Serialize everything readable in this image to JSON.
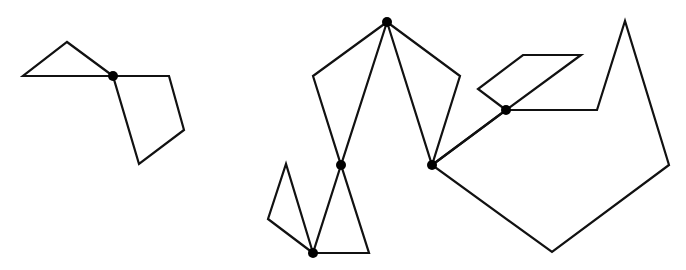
{
  "diagram": {
    "colors": {
      "stroke": "#111111",
      "vertex": "#000000",
      "background": "#ffffff"
    },
    "graphs": [
      {
        "id": "graph-left",
        "cut_vertices": [
          [
            113,
            76
          ]
        ],
        "blocks": [
          {
            "name": "triangle",
            "points": [
              [
                113,
                76
              ],
              [
                67,
                42
              ],
              [
                23,
                76
              ]
            ]
          },
          {
            "name": "quadrilateral",
            "points": [
              [
                113,
                76
              ],
              [
                169,
                76
              ],
              [
                184,
                130
              ],
              [
                139,
                164
              ]
            ]
          }
        ]
      },
      {
        "id": "graph-right",
        "cut_vertices": [
          [
            387,
            22
          ],
          [
            341,
            165
          ],
          [
            432,
            165
          ],
          [
            313,
            253
          ],
          [
            506,
            110
          ]
        ],
        "blocks": [
          {
            "name": "quad-upper-left",
            "points": [
              [
                387,
                22
              ],
              [
                313,
                76
              ],
              [
                341,
                165
              ]
            ]
          },
          {
            "name": "quad-upper-right",
            "points": [
              [
                387,
                22
              ],
              [
                460,
                76
              ],
              [
                432,
                165
              ]
            ]
          },
          {
            "name": "triangle-lower-middle",
            "points": [
              [
                341,
                165
              ],
              [
                313,
                253
              ],
              [
                369,
                253
              ]
            ]
          },
          {
            "name": "triangle-lower-left",
            "points": [
              [
                313,
                253
              ],
              [
                268,
                219
              ],
              [
                286,
                164
              ]
            ]
          },
          {
            "name": "bridge-edge",
            "points": [
              [
                432,
                165
              ],
              [
                506,
                110
              ]
            ],
            "open": true
          },
          {
            "name": "parallelogram",
            "points": [
              [
                506,
                110
              ],
              [
                478,
                89
              ],
              [
                523,
                55
              ],
              [
                581,
                55
              ]
            ]
          },
          {
            "name": "pentagon",
            "points": [
              [
                506,
                110
              ],
              [
                597,
                110
              ],
              [
                625,
                21
              ],
              [
                669,
                165
              ],
              [
                552,
                252
              ],
              [
                432,
                165
              ]
            ]
          }
        ]
      }
    ]
  }
}
